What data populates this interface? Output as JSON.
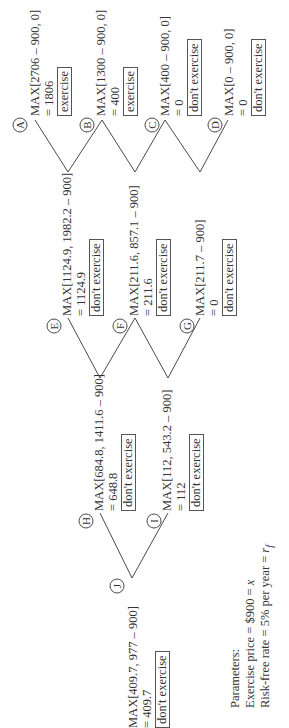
{
  "diagram": {
    "type": "binomial-option-tree",
    "orientation": "rotated-90-ccw",
    "nodes": {
      "A": {
        "label": "A",
        "formula": "MAX[2706 – 900, 0]",
        "value": "= 1806",
        "decision": "exercise"
      },
      "B": {
        "label": "B",
        "formula": "MAX[1300 – 900, 0]",
        "value": "= 400",
        "decision": "exercise"
      },
      "C": {
        "label": "C",
        "formula": "MAX[400 – 900, 0]",
        "value": "= 0",
        "decision": "don't exercise"
      },
      "D": {
        "label": "D",
        "formula": "MAX[0 – 900, 0]",
        "value": "= 0",
        "decision": "don't exercise"
      },
      "E": {
        "label": "E",
        "formula": "MAX[1124.9, 1982.2 – 900]",
        "value": "= 1124.9",
        "decision": "don't exercise"
      },
      "F": {
        "label": "F",
        "formula": "MAX[211.6, 857.1 – 900]",
        "value": "= 211.6",
        "decision": "don't exercise"
      },
      "G": {
        "label": "G",
        "formula": "MAX[211.7 – 900]",
        "value": "= 0",
        "decision": "don't exercise"
      },
      "H": {
        "label": "H",
        "formula": "MAX[684.8, 1411.6 – 900]",
        "value": "= 648.8",
        "decision": "don't exercise"
      },
      "I": {
        "label": "I",
        "formula": "MAX[112, 543.2 – 900]",
        "value": "= 112",
        "decision": "don't exercise"
      },
      "J": {
        "label": "J",
        "formula": "MAX[409.7, 977 – 900]",
        "value": "= 409.7",
        "decision": "don't exercise"
      }
    },
    "edges": [
      [
        "J",
        "H"
      ],
      [
        "J",
        "I"
      ],
      [
        "H",
        "E"
      ],
      [
        "H",
        "F"
      ],
      [
        "I",
        "F"
      ],
      [
        "I",
        "G"
      ],
      [
        "E",
        "A"
      ],
      [
        "E",
        "B"
      ],
      [
        "F",
        "B"
      ],
      [
        "F",
        "C"
      ],
      [
        "G",
        "C"
      ],
      [
        "G",
        "D"
      ]
    ],
    "parameters": {
      "title": "Parameters:",
      "exercise_price_text": "Exercise price = $900 = ",
      "exercise_price_symbol": "x",
      "risk_free_text": "Risk-free rate = 5% per year = ",
      "risk_free_symbol": "r",
      "risk_free_subscript": "f"
    }
  }
}
